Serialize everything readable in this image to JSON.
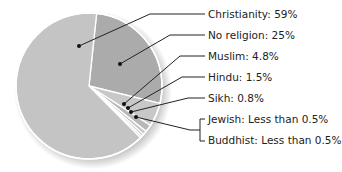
{
  "chart_data": {
    "type": "pie",
    "title": "",
    "series": [
      {
        "name": "Christianity",
        "value": 59,
        "label": "Christianity: 59%",
        "color": "#c4c4c4"
      },
      {
        "name": "No religion",
        "value": 25,
        "label": "No religion: 25%",
        "color": "#ababab"
      },
      {
        "name": "Muslim",
        "value": 4.8,
        "label": "Muslim: 4.8%",
        "color": "#c8c8c8"
      },
      {
        "name": "Hindu",
        "value": 1.5,
        "label": "Hindu: 1.5%",
        "color": "#b8b8b8"
      },
      {
        "name": "Sikh",
        "value": 0.8,
        "label": "Sikh: 0.8%",
        "color": "#c8c8c8"
      },
      {
        "name": "Jewish",
        "value": 0.5,
        "label": "Jewish: Less than 0.5%",
        "color": "#b8b8b8"
      },
      {
        "name": "Buddhist",
        "value": 0.4,
        "label": "Buddhist: Less than 0.5%",
        "color": "#c8c8c8"
      }
    ],
    "legend_position": "right",
    "grid": false
  },
  "labels": {
    "christianity": "Christianity: 59%",
    "no_religion": "No religion: 25%",
    "muslim": "Muslim: 4.8%",
    "hindu": "Hindu: 1.5%",
    "sikh": "Sikh: 0.8%",
    "jewish": "Jewish: Less than 0.5%",
    "buddhist": "Buddhist: Less than 0.5%"
  }
}
